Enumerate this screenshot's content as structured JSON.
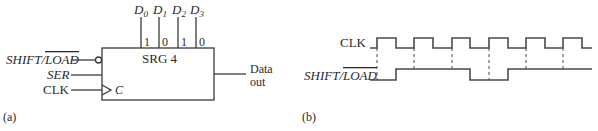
{
  "part_a": {
    "caption": "(a)",
    "block": {
      "title": "SRG 4",
      "clock_pin_label": "C"
    },
    "parallel_inputs": [
      {
        "name": "D",
        "sub": "0",
        "value": "1"
      },
      {
        "name": "D",
        "sub": "1",
        "value": "0"
      },
      {
        "name": "D",
        "sub": "2",
        "value": "1"
      },
      {
        "name": "D",
        "sub": "3",
        "value": "0"
      }
    ],
    "inputs": {
      "shift_load_prefix": "SHIFT/",
      "shift_load_overbar": "LOAD",
      "ser": "SER",
      "clk": "CLK"
    },
    "output": {
      "line1": "Data",
      "line2": "out"
    }
  },
  "part_b": {
    "caption": "(b)",
    "signals": {
      "clk_label": "CLK",
      "shift_load_prefix": "SHIFT/",
      "shift_load_overbar": "LOAD"
    },
    "clk_edges": {
      "rising": [
        377,
        414,
        452,
        489,
        526,
        563
      ],
      "falling": [
        396,
        433,
        470,
        508,
        545,
        582
      ]
    },
    "shift_load_transitions": [
      {
        "x": 396,
        "to": "high"
      },
      {
        "x": 470,
        "to": "low"
      },
      {
        "x": 508,
        "to": "high"
      }
    ],
    "colors": {
      "line": "#4a4a4a",
      "text": "#2a2a2a"
    }
  }
}
